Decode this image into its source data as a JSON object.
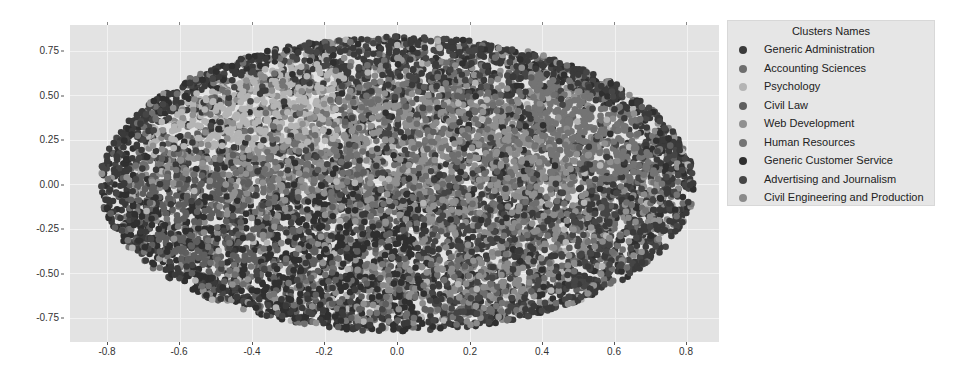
{
  "chart_data": {
    "type": "scatter",
    "title": "",
    "xlabel": "",
    "ylabel": "",
    "xlim": [
      -0.9,
      0.89
    ],
    "ylim": [
      -0.89,
      0.89
    ],
    "grid": true,
    "legend_position": "outside right",
    "x_ticks": [
      "-0.8",
      "-0.6",
      "-0.4",
      "-0.2",
      "0.0",
      "0.2",
      "0.4",
      "0.6",
      "0.8"
    ],
    "y_ticks": [
      "0.75",
      "0.50",
      "0.25",
      "0.00",
      "-0.25",
      "-0.50",
      "-0.75"
    ],
    "point_cloud": {
      "shape": "ellipse",
      "center": [
        0.0,
        0.0
      ],
      "radius_x": 0.82,
      "radius_y": 0.83,
      "approx_points": 9000
    },
    "legend_title": "Clusters Names",
    "series": [
      {
        "name": "Generic Administration",
        "color": "#3a3a3a",
        "region": "outer rim, top and left edge"
      },
      {
        "name": "Accounting Sciences",
        "color": "#6e6e6e",
        "region": "upper center, scattered"
      },
      {
        "name": "Psychology",
        "color": "#b4b4b4",
        "region": "upper-left lobe"
      },
      {
        "name": "Civil Law",
        "color": "#5e5e5e",
        "region": "left-lower lobe"
      },
      {
        "name": "Web Development",
        "color": "#909090",
        "region": "center"
      },
      {
        "name": "Human Resources",
        "color": "#747474",
        "region": "right lobe, upper right"
      },
      {
        "name": "Generic Customer Service",
        "color": "#2f2f2f",
        "region": "lower left / bottom"
      },
      {
        "name": "Advertising and Journalism",
        "color": "#454545",
        "region": "lower right"
      },
      {
        "name": "Civil Engineering and Production",
        "color": "#8a8a8a",
        "region": "lower center, scattered"
      }
    ]
  },
  "axes": {
    "y_labels": [
      "0.75",
      "0.50",
      "0.25",
      "0.00",
      "-0.25",
      "-0.50",
      "-0.75"
    ],
    "x_labels": [
      "-0.8",
      "-0.6",
      "-0.4",
      "-0.2",
      "0.0",
      "0.2",
      "0.4",
      "0.6",
      "0.8"
    ]
  },
  "legend": {
    "title": "Clusters Names",
    "items": [
      {
        "label": "Generic Administration",
        "color": "#3a3a3a"
      },
      {
        "label": "Accounting Sciences",
        "color": "#6e6e6e"
      },
      {
        "label": "Psychology",
        "color": "#b4b4b4"
      },
      {
        "label": "Civil Law",
        "color": "#5e5e5e"
      },
      {
        "label": "Web Development",
        "color": "#909090"
      },
      {
        "label": "Human Resources",
        "color": "#747474"
      },
      {
        "label": "Generic Customer Service",
        "color": "#2f2f2f"
      },
      {
        "label": "Advertising and Journalism",
        "color": "#454545"
      },
      {
        "label": "Civil Engineering and Production",
        "color": "#8a8a8a"
      }
    ]
  }
}
